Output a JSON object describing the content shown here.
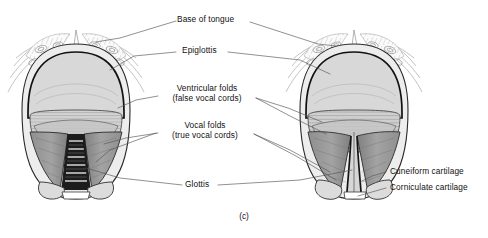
{
  "figure": {
    "caption": "(c)",
    "view_type": "laryngoscopic superior view of the larynx",
    "panels": [
      {
        "id": "left",
        "name": "glottis-open",
        "state": "open"
      },
      {
        "id": "right",
        "name": "glottis-closed",
        "state": "closed"
      }
    ]
  },
  "labels": [
    {
      "key": "base_of_tongue",
      "text": "Base of tongue",
      "text2": ""
    },
    {
      "key": "epiglottis",
      "text": "Epiglottis",
      "text2": ""
    },
    {
      "key": "ventricular_folds",
      "text": "Ventricular folds",
      "text2": "(false vocal cords)"
    },
    {
      "key": "vocal_folds",
      "text": "Vocal folds",
      "text2": "(true vocal cords)"
    },
    {
      "key": "glottis",
      "text": "Glottis",
      "text2": ""
    },
    {
      "key": "cuneiform",
      "text": "Cuneiform cartilage",
      "text2": ""
    },
    {
      "key": "corniculate",
      "text": "Corniculate cartilage",
      "text2": ""
    }
  ],
  "colors": {
    "ink": "#1a1a1a",
    "leader": "#555555",
    "outline": "#111111",
    "epiglottis_fill": "#d8d8d8",
    "vestibule_fill": "#c9c9c9",
    "fold_fill": "#9a9a9a",
    "fold_shadow": "#7c7c7c",
    "glottis_dark": "#1c1c1c",
    "tubercle_fill": "#dcdcdc",
    "tissue_light": "#f2f2f2",
    "background": "#ffffff"
  }
}
